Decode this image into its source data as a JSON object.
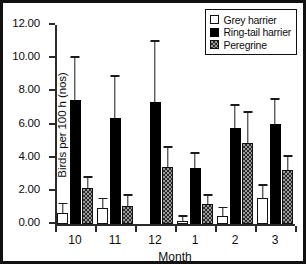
{
  "chart_data": {
    "type": "bar",
    "title": "",
    "xlabel": "Month",
    "ylabel": "Birds per 100 h (nos)",
    "categories": [
      "10",
      "11",
      "12",
      "1",
      "2",
      "3"
    ],
    "ylim": [
      0,
      12
    ],
    "yticks": [
      0,
      2,
      4,
      6,
      8,
      10,
      12
    ],
    "ytick_labels": [
      "0.00",
      "2.00",
      "4.00",
      "6.00",
      "8.00",
      "10.00",
      "12.00"
    ],
    "grid": false,
    "legend_position": "top-right",
    "error_bars": "upper-only",
    "series": [
      {
        "name": "Grey harrier",
        "fill": "white",
        "color": "#ffffff",
        "values": [
          0.65,
          0.95,
          0.0,
          0.2,
          0.5,
          1.55
        ],
        "errors_upper": [
          1.25,
          1.55,
          0.0,
          0.5,
          1.0,
          2.35
        ]
      },
      {
        "name": "Ring-tail harrier",
        "fill": "solid-black",
        "color": "#000000",
        "values": [
          7.5,
          6.4,
          7.35,
          3.4,
          5.8,
          6.05
        ],
        "errors_upper": [
          10.1,
          8.95,
          11.05,
          4.3,
          7.2,
          7.55
        ]
      },
      {
        "name": "Peregrine",
        "fill": "checkered-grey",
        "color": "#9a9a9a",
        "values": [
          2.2,
          1.1,
          3.45,
          1.2,
          4.9,
          3.25
        ],
        "errors_upper": [
          2.85,
          1.75,
          4.65,
          1.75,
          6.75,
          4.1
        ]
      }
    ]
  },
  "legend": {
    "entries": [
      {
        "label": "Grey harrier"
      },
      {
        "label": "Ring-tail harrier"
      },
      {
        "label": "Peregrine"
      }
    ]
  }
}
